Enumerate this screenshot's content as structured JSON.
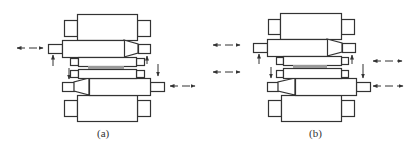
{
  "figure": {
    "width": 419,
    "height": 151,
    "line_color": "#333333",
    "strip_color": "#999999",
    "panels": [
      {
        "id": "a",
        "caption": "(a)",
        "caption_pos": [
          97,
          127
        ],
        "rolls": {
          "top_backup": {
            "body": [
              77,
              14,
              60,
              26
            ],
            "neck_left": [
              64,
              20,
              13,
              16
            ],
            "neck_right": [
              137,
              20,
              13,
              16
            ]
          },
          "upper_intermediate": {
            "body": [
              62,
              40,
              62,
              17
            ],
            "taper": {
              "x0": 124,
              "x1": 138,
              "y_top0": 40,
              "y_bot0": 57,
              "y_top1": 44,
              "y_bot1": 53
            },
            "neck_left": [
              48,
              44,
              14,
              9
            ],
            "neck_right": [
              138,
              44,
              12,
              9
            ]
          },
          "upper_work": {
            "body": [
              78,
              57,
              58,
              9
            ],
            "chock_left": [
              70,
              58,
              8,
              7
            ],
            "chock_right": [
              136,
              58,
              8,
              7
            ]
          },
          "strip": [
            88,
            66,
            36,
            3
          ],
          "lower_work": {
            "body": [
              78,
              69,
              58,
              9
            ],
            "chock_left": [
              70,
              70,
              8,
              7
            ],
            "chock_right": [
              136,
              70,
              8,
              7
            ]
          },
          "lower_intermediate": {
            "body": [
              89,
              78,
              61,
              17
            ],
            "taper": {
              "x0": 89,
              "x1": 74,
              "y_top0": 78,
              "y_bot0": 95,
              "y_top1": 82,
              "y_bot1": 91
            },
            "neck_left": [
              62,
              82,
              12,
              9
            ],
            "neck_right": [
              150,
              82,
              14,
              9
            ]
          },
          "bottom_backup": {
            "body": [
              77,
              95,
              60,
              26
            ],
            "neck_left": [
              64,
              100,
              13,
              16
            ],
            "neck_right": [
              137,
              100,
              13,
              16
            ]
          }
        },
        "shift_arrows": [
          {
            "x1": 17,
            "x2": 43,
            "y": 48
          },
          {
            "x1": 170,
            "x2": 195,
            "y": 86
          }
        ],
        "bend_arrows": [
          {
            "x": 53,
            "y_from": 66,
            "y_to": 55,
            "dir": "up"
          },
          {
            "x": 147,
            "y_from": 64,
            "y_to": 56,
            "dir": "up"
          },
          {
            "x": 69,
            "y_from": 68,
            "y_to": 79,
            "dir": "down"
          },
          {
            "x": 158,
            "y_from": 64,
            "y_to": 76,
            "dir": "down"
          }
        ]
      },
      {
        "id": "b",
        "caption": "(b)",
        "caption_pos": [
          309,
          127
        ],
        "rolls": {
          "top_backup": {
            "body": [
              280,
              13,
              61,
              26
            ],
            "neck_left": [
              268,
              19,
              12,
              15
            ],
            "neck_right": [
              341,
              19,
              13,
              15
            ]
          },
          "upper_intermediate": {
            "body": [
              267,
              39,
              60,
              17
            ],
            "taper": {
              "x0": 327,
              "x1": 342,
              "y_top0": 39,
              "y_bot0": 56,
              "y_top1": 43,
              "y_bot1": 52
            },
            "neck_left": [
              253,
              43,
              14,
              9
            ],
            "neck_right": [
              342,
              43,
              13,
              9
            ]
          },
          "upper_work": {
            "body": [
              283,
              56,
              58,
              9
            ],
            "chock_left": [
              276,
              57,
              7,
              7
            ],
            "chock_right": [
              341,
              57,
              7,
              7
            ]
          },
          "strip": [
            293,
            65,
            34,
            3
          ],
          "lower_work": {
            "body": [
              283,
              68,
              58,
              10
            ],
            "chock_left": [
              276,
              70,
              7,
              7
            ],
            "chock_right": [
              341,
              70,
              7,
              7
            ]
          },
          "lower_intermediate": {
            "body": [
              295,
              78,
              61,
              17
            ],
            "taper": {
              "x0": 295,
              "x1": 278,
              "y_top0": 78,
              "y_bot0": 95,
              "y_top1": 82,
              "y_bot1": 91
            },
            "neck_left": [
              267,
              82,
              11,
              9
            ],
            "neck_right": [
              356,
              82,
              14,
              9
            ]
          },
          "bottom_backup": {
            "body": [
              281,
              95,
              60,
              26
            ],
            "neck_left": [
              268,
              100,
              13,
              16
            ],
            "neck_right": [
              341,
              100,
              13,
              16
            ]
          }
        },
        "shift_arrows": [
          {
            "x1": 213,
            "x2": 240,
            "y": 45
          },
          {
            "x1": 213,
            "x2": 240,
            "y": 72
          },
          {
            "x1": 373,
            "x2": 402,
            "y": 61
          },
          {
            "x1": 373,
            "x2": 403,
            "y": 86
          }
        ],
        "bend_arrows": [
          {
            "x": 259,
            "y_from": 64,
            "y_to": 54,
            "dir": "up"
          },
          {
            "x": 352,
            "y_from": 64,
            "y_to": 55,
            "dir": "up"
          },
          {
            "x": 271,
            "y_from": 67,
            "y_to": 78,
            "dir": "down"
          },
          {
            "x": 363,
            "y_from": 64,
            "y_to": 78,
            "dir": "down"
          }
        ]
      }
    ]
  }
}
